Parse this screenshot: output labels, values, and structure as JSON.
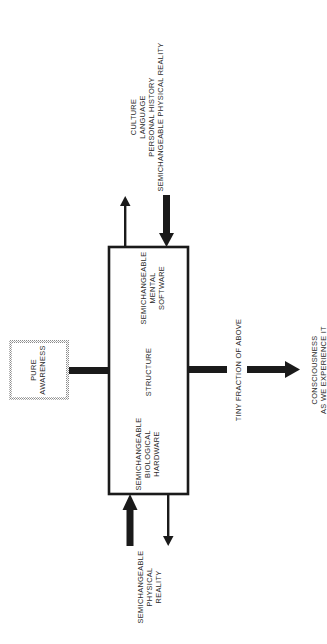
{
  "diagram": {
    "orientation": "rotated 90 degrees counter-clockwise",
    "main_box": {
      "sections": [
        {
          "lines": [
            "SEMICHANGEABLE",
            "MENTAL",
            "SOFTWARE"
          ]
        },
        {
          "lines": [
            "STRUCTURE"
          ]
        },
        {
          "lines": [
            "SEMICHANGEABLE",
            "BIOLOGICAL",
            "HARDWARE"
          ]
        }
      ]
    },
    "pure_awareness": {
      "lines": [
        "PURE",
        "AWARENESS"
      ]
    },
    "top_input": {
      "lines": [
        "CULTURE",
        "LANGUAGE",
        "PERSONAL HISTORY",
        "SEMICHANGEABLE PHYSICAL REALITY"
      ]
    },
    "bottom_input": {
      "lines": [
        "SEMICHANGEABLE",
        "PHYSICAL",
        "REALITY"
      ]
    },
    "output_label": "TINY FRACTION OF ABOVE",
    "result": {
      "lines": [
        "CONSCIOUSNESS",
        "AS WE EXPERIENCE IT"
      ]
    },
    "colors": {
      "ink": "#1a1a1a",
      "hatch": "#9a9a9a",
      "background": "#ffffff"
    }
  }
}
